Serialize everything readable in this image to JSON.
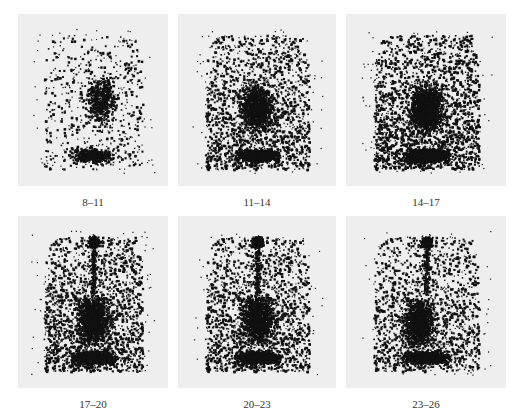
{
  "figure": {
    "panels": [
      {
        "label": "8–11",
        "row": 0,
        "col": 0,
        "x": 18,
        "y": 14,
        "w": 150,
        "h": 172,
        "density": 0.35,
        "hotspot_top": false,
        "center": [
          0.55,
          0.5
        ]
      },
      {
        "label": "11–14",
        "row": 0,
        "col": 1,
        "x": 178,
        "y": 14,
        "w": 158,
        "h": 172,
        "density": 0.7,
        "hotspot_top": false,
        "center": [
          0.5,
          0.55
        ]
      },
      {
        "label": "14–17",
        "row": 0,
        "col": 2,
        "x": 346,
        "y": 14,
        "w": 160,
        "h": 172,
        "density": 0.9,
        "hotspot_top": false,
        "center": [
          0.5,
          0.55
        ]
      },
      {
        "label": "17–20",
        "row": 1,
        "col": 0,
        "x": 18,
        "y": 216,
        "w": 150,
        "h": 172,
        "density": 0.75,
        "hotspot_top": true,
        "center": [
          0.5,
          0.6
        ]
      },
      {
        "label": "20–23",
        "row": 1,
        "col": 1,
        "x": 178,
        "y": 216,
        "w": 158,
        "h": 172,
        "density": 0.7,
        "hotspot_top": true,
        "center": [
          0.5,
          0.6
        ]
      },
      {
        "label": "23–26",
        "row": 1,
        "col": 2,
        "x": 346,
        "y": 216,
        "w": 160,
        "h": 172,
        "density": 0.65,
        "hotspot_top": true,
        "center": [
          0.45,
          0.62
        ]
      }
    ],
    "label_y": [
      196,
      398
    ],
    "colors": {
      "panel_bg": "#eeeeee",
      "dots": "#111111",
      "label": "#333333"
    }
  }
}
